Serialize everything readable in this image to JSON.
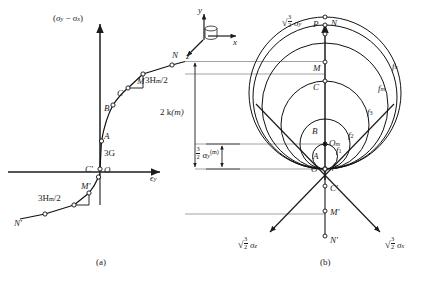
{
  "figure": {
    "panel_a_caption": "(a)",
    "panel_b_caption": "(b)"
  },
  "panel_a": {
    "y_axis_label_open": "(",
    "y_axis_sigma_y": "σ",
    "y_axis_sub_y": "y",
    "y_axis_minus": " − ",
    "y_axis_sigma_x": "σ",
    "y_axis_sub_x": "x",
    "y_axis_label_close": ")",
    "x_axis_label": "ϵ",
    "x_axis_sub": "y",
    "slope_upper": "3H",
    "slope_upper_sub": "m",
    "slope_upper_tail": "/2",
    "slope_lower": "3H",
    "slope_lower_sub": "m",
    "slope_lower_tail": "/2",
    "initial_slope": "3G",
    "points": [
      {
        "id": "N",
        "label": "N"
      },
      {
        "id": "M",
        "label": "M"
      },
      {
        "id": "C",
        "label": "C"
      },
      {
        "id": "B",
        "label": "B"
      },
      {
        "id": "A",
        "label": "A"
      },
      {
        "id": "O",
        "label": "O"
      },
      {
        "id": "Cp",
        "label": "C′"
      },
      {
        "id": "Mp",
        "label": "M′"
      },
      {
        "id": "Np",
        "label": "N′"
      }
    ]
  },
  "panel_b": {
    "axis_y_coef_num": "3",
    "axis_y_coef_den": "2",
    "axis_y_symbol": "σ",
    "axis_y_sub": "y",
    "axis_z_coef_num": "3",
    "axis_z_coef_den": "2",
    "axis_z_symbol": "σ",
    "axis_z_sub": "z",
    "axis_x_coef_num": "3",
    "axis_x_coef_den": "2",
    "axis_x_symbol": "σ",
    "axis_x_sub": "x",
    "surface_labels": [
      {
        "id": "f0",
        "base": "f",
        "sub": "0"
      },
      {
        "id": "f1",
        "base": "f",
        "sub": "1"
      },
      {
        "id": "f2",
        "base": "f",
        "sub": "2"
      },
      {
        "id": "f3",
        "base": "f",
        "sub": "3"
      },
      {
        "id": "fm",
        "base": "f",
        "sub": "m"
      },
      {
        "id": "fn",
        "base": "f",
        "sub": "n"
      }
    ],
    "point_labels": [
      {
        "id": "P",
        "label": "P"
      },
      {
        "id": "N",
        "label": "N"
      },
      {
        "id": "M",
        "label": "M"
      },
      {
        "id": "C",
        "label": "C"
      },
      {
        "id": "B",
        "label": "B"
      },
      {
        "id": "Om",
        "base": "O",
        "sub": "m"
      },
      {
        "id": "A",
        "label": "A"
      },
      {
        "id": "O",
        "label": "O"
      },
      {
        "id": "Cp",
        "label": "C′"
      },
      {
        "id": "Mp",
        "label": "M′"
      },
      {
        "id": "Np",
        "label": "N′"
      }
    ]
  },
  "dimensions": {
    "radius_label_base": "2 k",
    "radius_label_sup": "(m)",
    "center_label_num": "3",
    "center_label_den": "2",
    "center_label_symbol": "α",
    "center_label_sub": "y",
    "center_label_sup": "(m)"
  },
  "inset_axes": {
    "y": "y",
    "x": "x",
    "z": "z"
  },
  "colors": {
    "ink": "#1c1c1c",
    "curve": "#111111",
    "tie_line": "#6e6e6e",
    "background": "#ffffff"
  }
}
